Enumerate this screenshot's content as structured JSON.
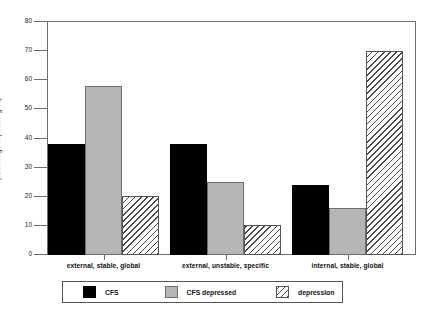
{
  "chart_data": {
    "type": "bar",
    "title": "",
    "xlabel": "",
    "ylabel": "percentage of patient group",
    "ylim": [
      0,
      80
    ],
    "yticks": [
      0,
      10,
      20,
      30,
      40,
      50,
      60,
      70,
      80
    ],
    "grid": false,
    "legend_position": "bottom",
    "categories": [
      "external, stable, global",
      "external, unstable, specific",
      "internal, stable, global"
    ],
    "series": [
      {
        "name": "CFS",
        "values": [
          38,
          38,
          24
        ],
        "color": "#000000",
        "fill": "solid-black"
      },
      {
        "name": "CFS depressed",
        "values": [
          58,
          25,
          16
        ],
        "color": "#b6b6b6",
        "fill": "solid-gray"
      },
      {
        "name": "depression",
        "values": [
          20,
          10,
          70
        ],
        "color": "#ffffff",
        "fill": "diagonal-hatch"
      }
    ]
  },
  "axis": {
    "y_tick_labels": [
      "0",
      "10",
      "20",
      "30",
      "40",
      "50",
      "60",
      "70",
      "80"
    ],
    "y_axis_title": "percentage of patient group"
  },
  "legend": {
    "entries": [
      {
        "label": "CFS",
        "swatch": "solid-black-swatch"
      },
      {
        "label": "CFS depressed",
        "swatch": "solid-gray-swatch"
      },
      {
        "label": "depression",
        "swatch": "hatched-swatch"
      }
    ]
  }
}
